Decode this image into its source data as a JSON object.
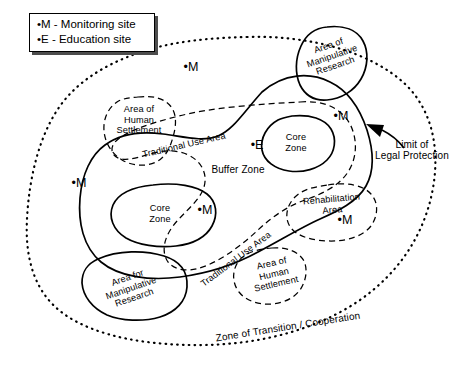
{
  "diagram": {
    "legend": {
      "name": "site-legend",
      "rows": [
        "•M - Monitoring site",
        "•E - Education site"
      ],
      "monitoring_symbol": "•M",
      "monitoring_label": "Monitoring site",
      "education_symbol": "•E",
      "education_label": "Education site"
    },
    "colors": {
      "ink": "#000000",
      "background": "#ffffff",
      "legend_shadow": "#4d4d4d"
    },
    "line_styles": {
      "core_zone": "solid",
      "buffer_zone": "solid",
      "traditional_use_area": "dashed",
      "area_of_human_settlement": "dashed",
      "rehabilitation_area": "dashed",
      "area_of_manipulative_research": "solid",
      "area_for_manipulative_research": "solid",
      "zone_of_transition_cooperation": "dotted"
    },
    "zones": {
      "core_zone_right": "Core\nZone",
      "core_zone_left": "Core\nZone",
      "buffer_zone": "Buffer Zone",
      "traditional_use_area_upper": "Traditional Use Area",
      "traditional_use_area_lower": "Traditional Use Area",
      "area_of_human_settlement_upper": "Area of\nHuman\nSettlement",
      "area_of_human_settlement_lower": "Area of\nHuman\nSettlement",
      "area_of_manipulative_research": "Area of\nManipulative\nResearch",
      "area_for_manipulative_research": "Area for\nManipulative\nResearch",
      "rehabilitation_area": "Rehabilitation\nArea",
      "zone_of_transition_cooperation": "Zone of Transition / Cooperation"
    },
    "annotation": {
      "limit_of_legal_protection": "Limit of\nLegal Protection"
    },
    "site_markers": {
      "monitoring": [
        "•M",
        "•M",
        "•M",
        "•M",
        "•M",
        "•M"
      ],
      "education": [
        "•E"
      ],
      "monitoring_count": 6,
      "education_count": 1
    }
  }
}
